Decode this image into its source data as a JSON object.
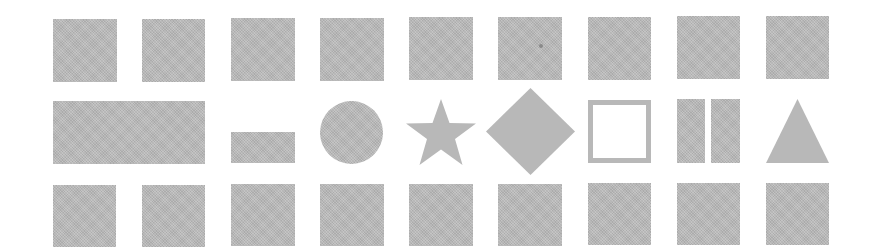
{
  "canvas": {
    "width": 875,
    "height": 249,
    "background": "#ffffff"
  },
  "colors": {
    "shape_fill": "#b8b8b8",
    "speck": "#8a8a8a"
  },
  "grid": {
    "rows": 3,
    "columns": 9,
    "column_x": [
      53,
      142,
      231,
      320,
      409,
      498,
      588,
      677,
      766
    ],
    "cell_size": 63
  },
  "rows": [
    {
      "name": "top-row",
      "y": 19,
      "shapes": [
        {
          "type": "square",
          "x": 53,
          "y": 19,
          "w": 64,
          "h": 63
        },
        {
          "type": "square",
          "x": 142,
          "y": 19,
          "w": 63,
          "h": 63
        },
        {
          "type": "square",
          "x": 231,
          "y": 18,
          "w": 64,
          "h": 63
        },
        {
          "type": "square",
          "x": 320,
          "y": 18,
          "w": 64,
          "h": 63
        },
        {
          "type": "square",
          "x": 409,
          "y": 17,
          "w": 64,
          "h": 63
        },
        {
          "type": "square",
          "x": 498,
          "y": 17,
          "w": 64,
          "h": 63,
          "speck": {
            "x": 540,
            "y": 46
          }
        },
        {
          "type": "square",
          "x": 588,
          "y": 17,
          "w": 63,
          "h": 63
        },
        {
          "type": "square",
          "x": 677,
          "y": 16,
          "w": 63,
          "h": 63
        },
        {
          "type": "square",
          "x": 766,
          "y": 16,
          "w": 63,
          "h": 63
        }
      ]
    },
    {
      "name": "middle-row",
      "y": 100,
      "shapes": [
        {
          "type": "wide-rectangle",
          "x": 53,
          "y": 101,
          "w": 152,
          "h": 63
        },
        {
          "type": "small-rectangle",
          "x": 231,
          "y": 132,
          "w": 64,
          "h": 31
        },
        {
          "type": "circle",
          "x": 320,
          "y": 101,
          "w": 63,
          "h": 63
        },
        {
          "type": "star",
          "x": 405,
          "y": 99,
          "w": 72,
          "h": 66
        },
        {
          "type": "diamond",
          "x": 486,
          "y": 88,
          "w": 89,
          "h": 87
        },
        {
          "type": "hollow-square",
          "x": 588,
          "y": 100,
          "w": 63,
          "h": 63,
          "border": 5
        },
        {
          "type": "twin-bars",
          "x": 677,
          "y": 99,
          "w": 63,
          "h": 64,
          "bar_w": 28,
          "gap": 6
        },
        {
          "type": "triangle",
          "x": 766,
          "y": 99,
          "w": 63,
          "h": 64
        }
      ]
    },
    {
      "name": "bottom-row",
      "y": 184,
      "shapes": [
        {
          "type": "square",
          "x": 53,
          "y": 185,
          "w": 63,
          "h": 62
        },
        {
          "type": "square",
          "x": 142,
          "y": 185,
          "w": 63,
          "h": 62
        },
        {
          "type": "square",
          "x": 231,
          "y": 184,
          "w": 64,
          "h": 62
        },
        {
          "type": "square",
          "x": 320,
          "y": 184,
          "w": 64,
          "h": 62
        },
        {
          "type": "square",
          "x": 409,
          "y": 184,
          "w": 64,
          "h": 62
        },
        {
          "type": "square",
          "x": 498,
          "y": 184,
          "w": 64,
          "h": 62
        },
        {
          "type": "square",
          "x": 588,
          "y": 183,
          "w": 63,
          "h": 62
        },
        {
          "type": "square",
          "x": 677,
          "y": 183,
          "w": 63,
          "h": 62
        },
        {
          "type": "square",
          "x": 766,
          "y": 183,
          "w": 63,
          "h": 62
        }
      ]
    }
  ]
}
